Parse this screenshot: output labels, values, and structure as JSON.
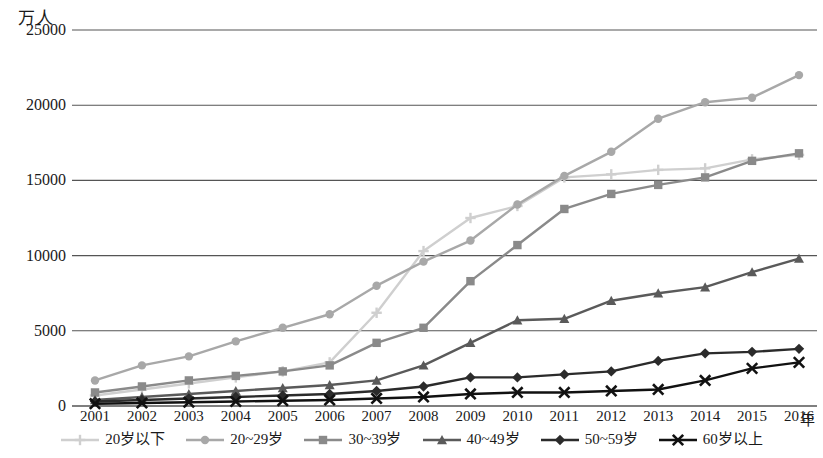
{
  "chart_data": {
    "type": "line",
    "title": "",
    "subtitle": "",
    "xlabel": "年",
    "ylabel": "万人",
    "y_unit_caption": "万人",
    "x_unit_caption": "年",
    "grid": true,
    "legend_position": "bottom",
    "xlim": [
      2001,
      2016
    ],
    "ylim": [
      0,
      25000
    ],
    "y_ticks": [
      0,
      5000,
      10000,
      15000,
      20000,
      25000
    ],
    "y_tick_labels": [
      "0",
      "5000",
      "10000",
      "15000",
      "20000",
      "25000"
    ],
    "categories": [
      2001,
      2002,
      2003,
      2004,
      2005,
      2006,
      2007,
      2008,
      2009,
      2010,
      2011,
      2012,
      2013,
      2014,
      2015,
      2016
    ],
    "x_tick_labels": [
      "2001",
      "2002",
      "2003",
      "2004",
      "2005",
      "2006",
      "2007",
      "2008",
      "2009",
      "2010",
      "2011",
      "2012",
      "2013",
      "2014",
      "2015",
      "2016"
    ],
    "series": [
      {
        "name": "20岁以下",
        "marker": "plus",
        "color": "#cfcfcf",
        "values": [
          700,
          1100,
          1500,
          1900,
          2300,
          2900,
          6200,
          10300,
          12500,
          13300,
          15200,
          15400,
          15700,
          15800,
          16400,
          16700
        ]
      },
      {
        "name": "20~29岁",
        "marker": "circle",
        "color": "#a8a8a8",
        "values": [
          1700,
          2700,
          3300,
          4300,
          5200,
          6100,
          8000,
          9600,
          11000,
          13400,
          15300,
          16900,
          19100,
          20200,
          20500,
          22000
        ]
      },
      {
        "name": "30~39岁",
        "marker": "square",
        "color": "#8a8a8a",
        "values": [
          900,
          1300,
          1700,
          2000,
          2300,
          2700,
          4200,
          5200,
          8300,
          10700,
          13100,
          14100,
          14700,
          15200,
          16300,
          16800
        ]
      },
      {
        "name": "40~49岁",
        "marker": "triangle",
        "color": "#5a5a5a",
        "values": [
          400,
          600,
          800,
          1000,
          1200,
          1400,
          1700,
          2700,
          4200,
          5700,
          5800,
          7000,
          7500,
          7900,
          8900,
          9800
        ]
      },
      {
        "name": "50~59岁",
        "marker": "diamond",
        "color": "#2b2b2b",
        "values": [
          300,
          400,
          500,
          600,
          700,
          800,
          1000,
          1300,
          1900,
          1900,
          2100,
          2300,
          3000,
          3500,
          3600,
          3800
        ]
      },
      {
        "name": "60岁以上",
        "marker": "cross",
        "color": "#111111",
        "values": [
          150,
          200,
          250,
          300,
          350,
          400,
          500,
          600,
          800,
          900,
          900,
          1000,
          1100,
          1700,
          2500,
          2900
        ]
      }
    ]
  }
}
